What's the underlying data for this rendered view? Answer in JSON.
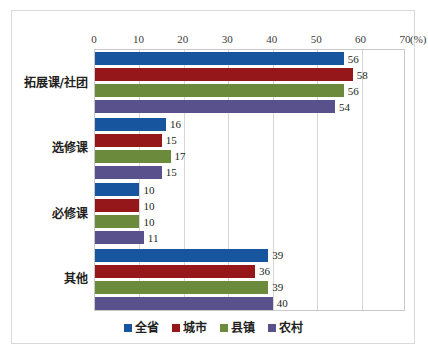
{
  "chart_data": {
    "type": "bar",
    "orientation": "horizontal",
    "title": "",
    "xlabel": "(%)",
    "ylabel": "",
    "xlim": [
      0,
      70
    ],
    "xticks": [
      0,
      10,
      20,
      30,
      40,
      50,
      60,
      70
    ],
    "xtick_labels": [
      "0",
      "10",
      "20",
      "30",
      "40",
      "50",
      "60",
      "70"
    ],
    "unit_label": "(%)",
    "grid": true,
    "legend_position": "bottom",
    "categories": [
      "拓展课/社团",
      "选修课",
      "必修课",
      "其他"
    ],
    "series": [
      {
        "name": "全省",
        "color": "#17559E",
        "values": [
          56,
          16,
          10,
          39
        ]
      },
      {
        "name": "城市",
        "color": "#95171A",
        "values": [
          58,
          15,
          10,
          36
        ]
      },
      {
        "name": "县镇",
        "color": "#6B8A3C",
        "values": [
          56,
          17,
          10,
          39
        ]
      },
      {
        "name": "农村",
        "color": "#58518C",
        "values": [
          54,
          15,
          11,
          40
        ]
      }
    ]
  }
}
